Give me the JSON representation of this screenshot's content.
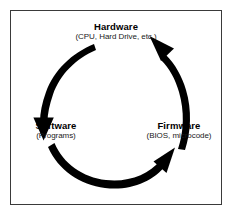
{
  "figure": {
    "background_color": "#ffffff",
    "border_color": "#3a3a3a",
    "arrow_color": "#000000"
  },
  "nodes": [
    {
      "id": "hardware",
      "label": "Hardware",
      "sublabel": "(CPU, Hard Drive, etc.)",
      "position": "top"
    },
    {
      "id": "software",
      "label": "Software",
      "sublabel": "(Programs)",
      "position": "bottom-left"
    },
    {
      "id": "firmware",
      "label": "Firmware",
      "sublabel": "(BIOS, microcode)",
      "position": "bottom-right"
    }
  ],
  "arrows": [
    {
      "id": "hardware-to-software",
      "from": "Hardware",
      "to": "Software",
      "icon": "curved-arrow-down-left-icon"
    },
    {
      "id": "software-to-firmware",
      "from": "Software",
      "to": "Firmware",
      "icon": "curved-arrow-right-icon"
    },
    {
      "id": "firmware-to-hardware",
      "from": "Firmware",
      "to": "Hardware",
      "icon": "curved-arrow-up-left-icon"
    }
  ]
}
